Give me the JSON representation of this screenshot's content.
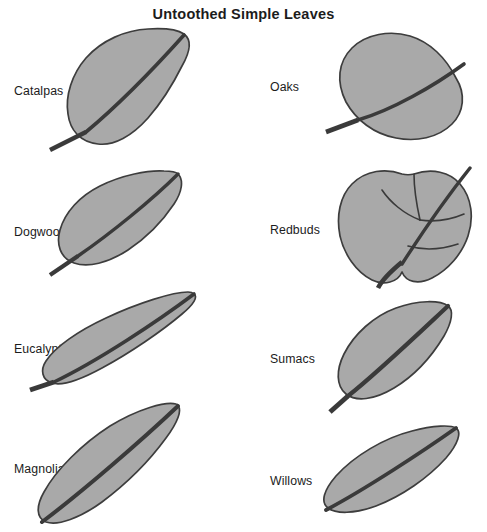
{
  "figure": {
    "title": "Untoothed Simple Leaves",
    "background_color": "#ffffff",
    "leaf_fill_color": "#a9a9a9",
    "leaf_outline_color": "#3d3d3d",
    "midrib_color": "#3a3a3a",
    "label_color": "#1c1c1c",
    "columns": 2,
    "rows": 4
  },
  "leaves": [
    {
      "label": "Catalpas",
      "column": "left",
      "row": 1,
      "shape": "broad-ovate-leaf"
    },
    {
      "label": "Dogwoods",
      "column": "left",
      "row": 2,
      "shape": "elliptic-ovate-leaf"
    },
    {
      "label": "Eucalyptus",
      "column": "left",
      "row": 3,
      "shape": "narrow-lanceolate-leaf"
    },
    {
      "label": "Magnolias",
      "column": "left",
      "row": 4,
      "shape": "oblong-elliptic-leaf"
    },
    {
      "label": "Oaks",
      "column": "right",
      "row": 1,
      "shape": "broad-oblong-leaf"
    },
    {
      "label": "Redbuds",
      "column": "right",
      "row": 2,
      "shape": "cordate-heart-leaf"
    },
    {
      "label": "Sumacs",
      "column": "right",
      "row": 3,
      "shape": "ovate-leaf"
    },
    {
      "label": "Willows",
      "column": "right",
      "row": 4,
      "shape": "lanceolate-leaf"
    }
  ]
}
